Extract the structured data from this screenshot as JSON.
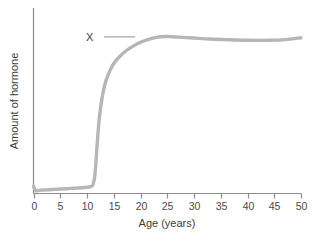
{
  "chart_data": {
    "type": "line",
    "title": "",
    "xlabel": "Age (years)",
    "ylabel": "Amount of hormone",
    "xlim": [
      0,
      50
    ],
    "ylim": [
      0,
      1
    ],
    "grid": false,
    "legend": "none",
    "x_ticks": [
      "0",
      "5",
      "10",
      "15",
      "20",
      "25",
      "30",
      "35",
      "40",
      "45",
      "50"
    ],
    "x_tick_values": [
      0,
      5,
      10,
      15,
      20,
      25,
      30,
      35,
      40,
      45,
      50
    ],
    "y_ticks": [],
    "series": [
      {
        "name": "X",
        "color": "#b6b6b6",
        "x": [
          0,
          0.4,
          1,
          2,
          3,
          4,
          5,
          6,
          7,
          8,
          9,
          10,
          10.6,
          11.1,
          11.5,
          11.9,
          12.3,
          12.8,
          13.3,
          13.9,
          14.6,
          15.4,
          16.4,
          17.5,
          18.7,
          20,
          21.5,
          23,
          24.5,
          26,
          28,
          30,
          33,
          36,
          40,
          44,
          47,
          50
        ],
        "y": [
          0.045,
          0.018,
          0.019,
          0.021,
          0.023,
          0.025,
          0.027,
          0.029,
          0.031,
          0.033,
          0.035,
          0.038,
          0.042,
          0.052,
          0.12,
          0.3,
          0.46,
          0.58,
          0.66,
          0.72,
          0.77,
          0.81,
          0.845,
          0.875,
          0.9,
          0.922,
          0.94,
          0.952,
          0.957,
          0.956,
          0.952,
          0.948,
          0.942,
          0.938,
          0.934,
          0.934,
          0.938,
          0.95
        ]
      }
    ],
    "annotations": [
      {
        "label": "X",
        "label_x": 10.5,
        "label_y": 0.955,
        "leader_from_x": 13.2,
        "leader_to_x": 19.0,
        "leader_y": 0.955,
        "color": "#3d3d3d"
      }
    ],
    "colors": {
      "curve": "#b6b6b6",
      "axis": "#8c8c8c",
      "text": "#3d3d3d",
      "tick_text": "#4a4a4a",
      "leader": "#9a9a9a",
      "background": "#ffffff"
    },
    "line_width": 3.4
  }
}
